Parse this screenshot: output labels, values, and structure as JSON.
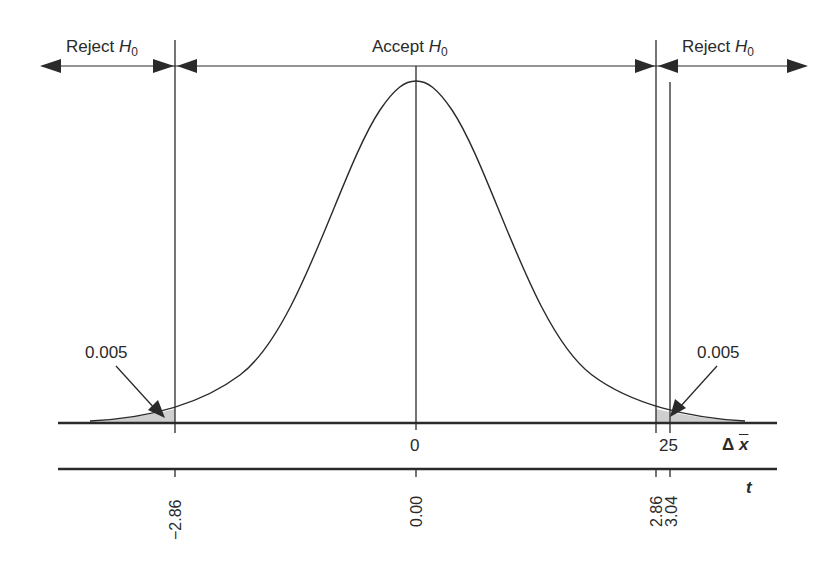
{
  "diagram": {
    "regions": [
      {
        "label": "Reject",
        "symbol": "H",
        "subscript": "0",
        "side": "left"
      },
      {
        "label": "Accept",
        "symbol": "H",
        "subscript": "0",
        "side": "center"
      },
      {
        "label": "Reject",
        "symbol": "H",
        "subscript": "0",
        "side": "right"
      }
    ],
    "tail_areas": {
      "left": "0.005",
      "right": "0.005"
    },
    "delta_x_axis": {
      "name": "Δ x̄",
      "delta": "Δ",
      "xbar": "x",
      "ticks": [
        "0",
        "25"
      ]
    },
    "t_axis": {
      "name": "t",
      "ticks": [
        "−2.86",
        "0.00",
        "2.86",
        "3.04"
      ]
    },
    "colors": {
      "line": "#2a2a2a",
      "shade": "#cfcfcf",
      "background": "#ffffff"
    }
  }
}
